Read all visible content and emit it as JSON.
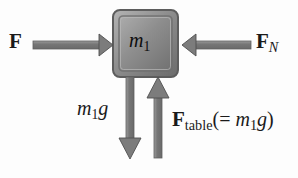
{
  "diagram": {
    "background_color": "#fdfdfd",
    "block": {
      "label_main": "m",
      "label_sub": "1",
      "fill_light": "#a8a8a8",
      "fill_dark": "#6e6e6e",
      "border_color": "#5a5a5a"
    },
    "arrow_color": "#7a7a7a",
    "arrow_outline": "#4a4a4a",
    "text_color": "#1a1a1a",
    "forces": [
      {
        "name": "applied-force",
        "symbol": "F",
        "subscript": "",
        "direction": "right",
        "label_position": "left"
      },
      {
        "name": "normal-horizontal-force",
        "symbol": "F",
        "subscript": "N",
        "subscript_style": "italic",
        "direction": "left",
        "label_position": "right"
      },
      {
        "name": "weight-force",
        "symbol": "m",
        "subscript": "1",
        "trailing": "g",
        "direction": "down",
        "label_position": "left-of-arrow"
      },
      {
        "name": "table-normal-force",
        "symbol": "F",
        "subscript": "table",
        "subscript_style": "roman",
        "equals_text": "(= ",
        "equals_mass": "m",
        "equals_sub": "1",
        "equals_g": "g",
        "equals_close": ")",
        "direction": "up",
        "label_position": "right-of-arrow"
      }
    ]
  }
}
